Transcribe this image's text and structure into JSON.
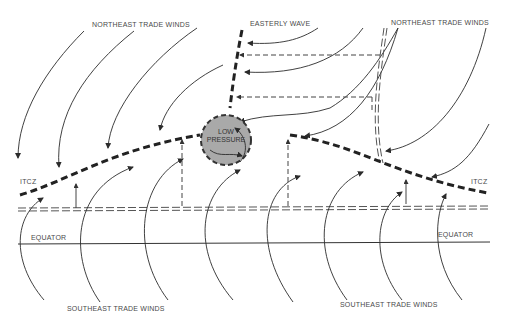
{
  "diagram": {
    "labels": {
      "northeast_trade_winds_left": "NORTHEAST TRADE WINDS",
      "easterly_wave": "EASTERLY WAVE",
      "northeast_trade_winds_right": "NORTHEAST TRADE WINDS",
      "low_pressure_line1": "LOW",
      "low_pressure_line2": "PRESSURE",
      "itcz_left": "ITCZ",
      "itcz_right": "ITCZ",
      "equator_left": "EQUATOR",
      "equator_right": "EQUATOR",
      "southeast_trade_winds_left": "SOUTHEAST TRADE WINDS",
      "southeast_trade_winds_right": "SOUTHEAST TRADE WINDS"
    },
    "colors": {
      "low_pressure_fill": "#a9a9a9",
      "line": "#222222",
      "text": "#4a4a4a",
      "background": "#ffffff"
    }
  }
}
